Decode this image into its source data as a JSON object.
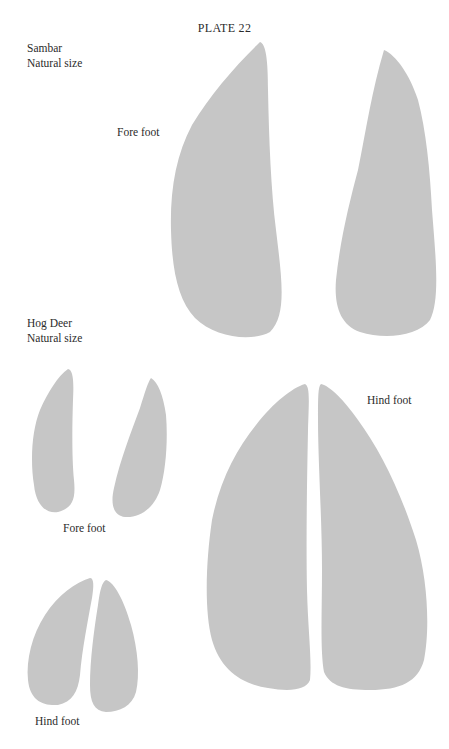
{
  "page": {
    "title": "PLATE 22",
    "print_color": "#c6c6c6",
    "background": "#ffffff"
  },
  "sections": [
    {
      "species": "Sambar",
      "scale": "Natural size",
      "captions": {
        "fore_foot": "Fore foot"
      },
      "prints": [
        "sambar-fore-left-hoof",
        "sambar-fore-right-hoof"
      ]
    },
    {
      "species": "Hog Deer",
      "scale": "Natural size",
      "captions": {
        "fore_foot": "Fore foot",
        "hind_foot": "Hind foot"
      },
      "prints": [
        "hogdeer-fore-left-hoof",
        "hogdeer-fore-right-hoof",
        "hogdeer-hind-left-hoof",
        "hogdeer-hind-right-hoof"
      ]
    }
  ],
  "large_hind": {
    "caption": "Hind foot",
    "prints": [
      "large-hind-left-hoof",
      "large-hind-right-hoof"
    ]
  }
}
